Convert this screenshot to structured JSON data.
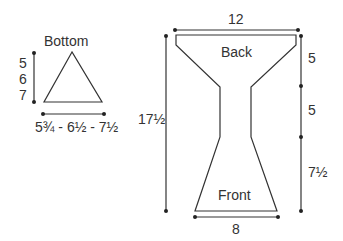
{
  "bottom": {
    "title": "Bottom",
    "heights": [
      "5",
      "6",
      "7"
    ],
    "width": "5¾ - 6½ - 7½"
  },
  "main": {
    "top_width": "12",
    "back_label": "Back",
    "front_label": "Front",
    "bottom_width": "8",
    "total_height": "17½",
    "segments": [
      "5",
      "5",
      "7½"
    ]
  }
}
